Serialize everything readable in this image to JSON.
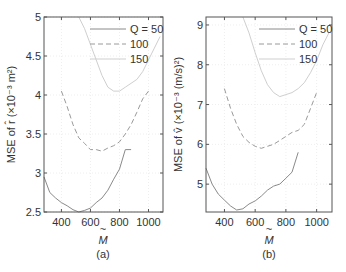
{
  "chart_data": [
    {
      "type": "line",
      "panel_label": "(a)",
      "title": "",
      "xlabel": "M̃",
      "ylabel": "MSE of r̂ (×10⁻³ m²)",
      "xlim": [
        280,
        1100
      ],
      "ylim": [
        2.5,
        5.0
      ],
      "xticks": [
        400,
        600,
        800,
        1000
      ],
      "yticks": [
        2.5,
        3,
        3.5,
        4,
        4.5,
        5
      ],
      "ytick_labels": [
        "2.5",
        "3",
        "3.5",
        "4",
        "4.5",
        "5"
      ],
      "grid": true,
      "legend_position": "upper right",
      "series": [
        {
          "name": "Q = 50",
          "style": "solid",
          "x": [
            280,
            320,
            360,
            400,
            440,
            480,
            520,
            560,
            600,
            640,
            680,
            720,
            760,
            800,
            840,
            880
          ],
          "y": [
            2.95,
            2.75,
            2.68,
            2.62,
            2.58,
            2.53,
            2.5,
            2.52,
            2.55,
            2.62,
            2.68,
            2.78,
            2.92,
            3.05,
            3.3,
            3.3
          ]
        },
        {
          "name": "100",
          "style": "dashed",
          "x": [
            400,
            440,
            480,
            520,
            560,
            600,
            640,
            680,
            720,
            760,
            800,
            840,
            880,
            920,
            960,
            1000
          ],
          "y": [
            4.05,
            3.85,
            3.62,
            3.45,
            3.38,
            3.3,
            3.3,
            3.28,
            3.32,
            3.35,
            3.4,
            3.5,
            3.62,
            3.78,
            3.95,
            4.05
          ]
        },
        {
          "name": "150",
          "style": "dotted",
          "x": [
            520,
            560,
            600,
            640,
            680,
            720,
            760,
            800,
            840,
            880,
            920,
            960,
            1000,
            1040,
            1080
          ],
          "y": [
            5.0,
            4.85,
            4.65,
            4.45,
            4.25,
            4.1,
            4.05,
            4.05,
            4.1,
            4.15,
            4.2,
            4.3,
            4.45,
            4.6,
            4.75
          ]
        }
      ]
    },
    {
      "type": "line",
      "panel_label": "(b)",
      "title": "",
      "xlabel": "M̃",
      "ylabel": "MSE of v̂ (×10⁻³ (m/s)²)",
      "xlim": [
        280,
        1100
      ],
      "ylim": [
        4.3,
        9.2
      ],
      "xticks": [
        400,
        600,
        800,
        1000
      ],
      "yticks": [
        5,
        6,
        7,
        8,
        9
      ],
      "ytick_labels": [
        "5",
        "6",
        "7",
        "8",
        "9"
      ],
      "grid": true,
      "legend_position": "upper right",
      "series": [
        {
          "name": "Q = 50",
          "style": "solid",
          "x": [
            280,
            320,
            360,
            400,
            440,
            480,
            520,
            560,
            600,
            640,
            680,
            720,
            760,
            800,
            840,
            880
          ],
          "y": [
            5.4,
            5.0,
            4.75,
            4.6,
            4.45,
            4.35,
            4.38,
            4.5,
            4.58,
            4.7,
            4.85,
            4.95,
            5.0,
            5.15,
            5.3,
            5.8
          ]
        },
        {
          "name": "100",
          "style": "dashed",
          "x": [
            400,
            440,
            480,
            520,
            560,
            600,
            640,
            680,
            720,
            760,
            800,
            840,
            880,
            920,
            960,
            1000
          ],
          "y": [
            7.4,
            6.9,
            6.5,
            6.2,
            6.05,
            5.95,
            5.9,
            5.95,
            6.0,
            6.1,
            6.2,
            6.3,
            6.35,
            6.5,
            6.9,
            7.3
          ]
        },
        {
          "name": "150",
          "style": "dotted",
          "x": [
            520,
            560,
            600,
            640,
            680,
            720,
            760,
            800,
            840,
            880,
            920,
            960,
            1000,
            1040,
            1080
          ],
          "y": [
            9.2,
            8.8,
            8.3,
            7.85,
            7.5,
            7.3,
            7.2,
            7.25,
            7.3,
            7.4,
            7.55,
            7.8,
            8.1,
            8.5,
            8.8
          ]
        }
      ]
    }
  ],
  "panels": [
    {
      "label": "(a)",
      "xlabel": "M",
      "ylabel_text": "MSE of r̂ (×10⁻³ m²)"
    },
    {
      "label": "(b)",
      "xlabel": "M",
      "ylabel_text": "MSE of v̂ (×10⁻³ (m/s)²)"
    }
  ],
  "legend": [
    "Q = 50",
    "100",
    "150"
  ],
  "colors": {
    "q50": "#8a8a8a",
    "q100": "#9a9a9a",
    "q150": "#cfcfcf",
    "axis": "#555555",
    "grid": "#eeeeee"
  }
}
